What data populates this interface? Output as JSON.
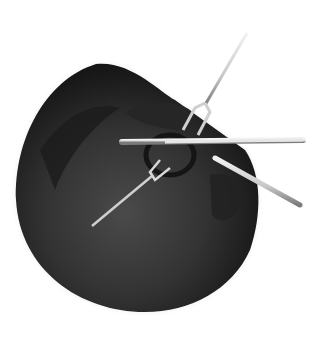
{
  "image": {
    "alt": "Grayscale photograph of a circular field showing an ear with a forked retractor instrument and a probe inserted",
    "colors": {
      "background": "#ffffff",
      "field_dark": "#1a1a1a",
      "field_mid": "#3a3a3a",
      "field_light": "#555555",
      "instrument": "#d8d8d8",
      "instrument_shade": "#8a8a8a"
    }
  }
}
